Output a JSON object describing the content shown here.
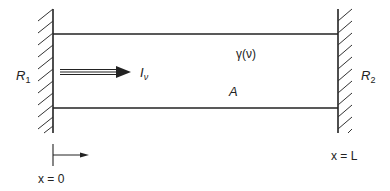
{
  "diagram": {
    "colors": {
      "ink": "#222222",
      "background": "#ffffff"
    },
    "left_mirror": {
      "label": "R",
      "subscript": "1"
    },
    "right_mirror": {
      "label": "R",
      "subscript": "2"
    },
    "beam": {
      "label": "I",
      "subscript": "ν"
    },
    "gain": {
      "label": "γ(ν)"
    },
    "area": {
      "label": "A"
    },
    "origin_marker": {
      "label": "x = 0"
    },
    "end_marker": {
      "label": "x = L"
    }
  }
}
